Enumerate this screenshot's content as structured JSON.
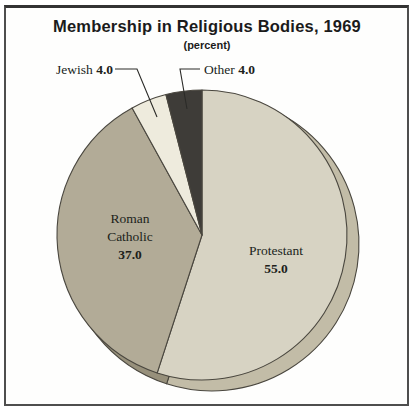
{
  "chart_data": {
    "type": "pie",
    "title": "Membership in Religious Bodies, 1969",
    "subtitle": "(percent)",
    "start_angle_deg": -90,
    "direction": "clockwise",
    "unit": "percent",
    "outline_color": "#4a473f",
    "slices": [
      {
        "label": "Protestant",
        "value": 55.0,
        "value_label": "55.0",
        "color": "#d7d3c3",
        "side_color": "#c2bca7",
        "label_placement": "inside"
      },
      {
        "label": "Roman Catholic",
        "value": 37.0,
        "value_label": "37.0",
        "color": "#b2ab97",
        "side_color": "#97907b",
        "label_placement": "inside"
      },
      {
        "label": "Jewish",
        "value": 4.0,
        "value_label": "4.0",
        "color": "#eeebdd",
        "side_color": "#d5d1bf",
        "label_placement": "outside-callout"
      },
      {
        "label": "Other",
        "value": 4.0,
        "value_label": "4.0",
        "color": "#3e3c38",
        "side_color": "#2b2a27",
        "label_placement": "outside-callout"
      }
    ]
  }
}
